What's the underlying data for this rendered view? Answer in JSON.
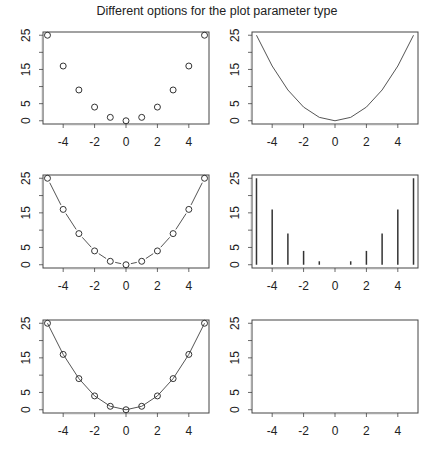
{
  "title": "Different options for the plot parameter type",
  "chart_data": [
    {
      "type": "scatter",
      "plot_type_param": "p",
      "title": "",
      "x": [
        -5,
        -4,
        -3,
        -2,
        -1,
        0,
        1,
        2,
        3,
        4,
        5
      ],
      "y": [
        25,
        16,
        9,
        4,
        1,
        0,
        1,
        4,
        9,
        16,
        25
      ],
      "xticks": [
        -4,
        -2,
        0,
        2,
        4
      ],
      "yticks": [
        0,
        5,
        15,
        25
      ],
      "xlim": [
        -5,
        5
      ],
      "ylim": [
        0,
        25
      ],
      "grid": false
    },
    {
      "type": "line",
      "plot_type_param": "l",
      "title": "",
      "x": [
        -5,
        -4,
        -3,
        -2,
        -1,
        0,
        1,
        2,
        3,
        4,
        5
      ],
      "y": [
        25,
        16,
        9,
        4,
        1,
        0,
        1,
        4,
        9,
        16,
        25
      ],
      "xticks": [
        -4,
        -2,
        0,
        2,
        4
      ],
      "yticks": [
        0,
        5,
        15,
        25
      ],
      "xlim": [
        -5,
        5
      ],
      "ylim": [
        0,
        25
      ],
      "grid": false
    },
    {
      "type": "line",
      "plot_type_param": "b",
      "title": "",
      "x": [
        -5,
        -4,
        -3,
        -2,
        -1,
        0,
        1,
        2,
        3,
        4,
        5
      ],
      "y": [
        25,
        16,
        9,
        4,
        1,
        0,
        1,
        4,
        9,
        16,
        25
      ],
      "xticks": [
        -4,
        -2,
        0,
        2,
        4
      ],
      "yticks": [
        0,
        5,
        15,
        25
      ],
      "xlim": [
        -5,
        5
      ],
      "ylim": [
        0,
        25
      ],
      "grid": false
    },
    {
      "type": "bar",
      "plot_type_param": "h",
      "title": "",
      "x": [
        -5,
        -4,
        -3,
        -2,
        -1,
        0,
        1,
        2,
        3,
        4,
        5
      ],
      "y": [
        25,
        16,
        9,
        4,
        1,
        0,
        1,
        4,
        9,
        16,
        25
      ],
      "xticks": [
        -4,
        -2,
        0,
        2,
        4
      ],
      "yticks": [
        0,
        5,
        15,
        25
      ],
      "xlim": [
        -5,
        5
      ],
      "ylim": [
        0,
        25
      ],
      "grid": false
    },
    {
      "type": "line",
      "plot_type_param": "o",
      "title": "",
      "x": [
        -5,
        -4,
        -3,
        -2,
        -1,
        0,
        1,
        2,
        3,
        4,
        5
      ],
      "y": [
        25,
        16,
        9,
        4,
        1,
        0,
        1,
        4,
        9,
        16,
        25
      ],
      "xticks": [
        -4,
        -2,
        0,
        2,
        4
      ],
      "yticks": [
        0,
        5,
        15,
        25
      ],
      "xlim": [
        -5,
        5
      ],
      "ylim": [
        0,
        25
      ],
      "grid": false
    },
    {
      "type": "scatter",
      "plot_type_param": "n",
      "title": "",
      "x": [],
      "y": [],
      "xticks": [
        -4,
        -2,
        0,
        2,
        4
      ],
      "yticks": [
        0,
        5,
        15,
        25
      ],
      "xlim": [
        -5,
        5
      ],
      "ylim": [
        0,
        25
      ],
      "grid": false
    }
  ]
}
